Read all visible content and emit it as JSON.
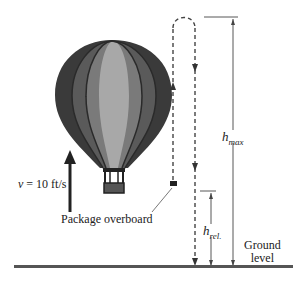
{
  "diagram": {
    "velocity_label": {
      "var": "v",
      "eq": " = 10 ft/s"
    },
    "package_label": "Package overboard",
    "h_max": {
      "base": "h",
      "sub": "max"
    },
    "h_rel": {
      "base": "h",
      "sub": "rel."
    },
    "ground_label": {
      "line1": "Ground",
      "line2": "level"
    },
    "colors": {
      "balloon_dark": "#3a3a3a",
      "balloon_mid": "#6e6e6e",
      "balloon_light": "#a8a8a8",
      "line": "#333333",
      "ground": "#555555"
    }
  }
}
